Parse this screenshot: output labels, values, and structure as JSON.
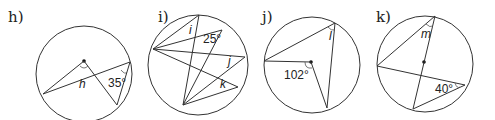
{
  "figures": [
    {
      "label": "h)",
      "given_angle": "35°",
      "unknown": "h"
    },
    {
      "label": "i)",
      "given_angle": "25°",
      "unknowns": [
        "i",
        "j",
        "k"
      ]
    },
    {
      "label": "j)",
      "given_angle": "102°",
      "unknown": "l"
    },
    {
      "label": "k)",
      "given_angle": "40°",
      "unknown": "m"
    }
  ]
}
